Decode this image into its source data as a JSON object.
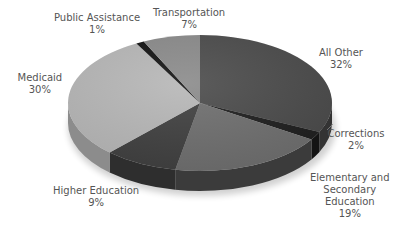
{
  "chart_data": {
    "type": "pie",
    "style": "3d-exploded-none",
    "title": "",
    "start_angle_deg": 0,
    "direction": "clockwise",
    "slices": [
      {
        "label": "All Other",
        "value": 32,
        "display": "32%",
        "color": "#4a4a4a",
        "side": "#333333"
      },
      {
        "label": "Corrections",
        "value": 2,
        "display": "2%",
        "color": "#1e1e1e",
        "side": "#141414"
      },
      {
        "label": "Elementary and Secondary Education",
        "value": 19,
        "display": "19%",
        "color": "#6e6e6e",
        "side": "#3b3b3b"
      },
      {
        "label": "Higher Education",
        "value": 9,
        "display": "9%",
        "color": "#3f3f3f",
        "side": "#2e2e2e"
      },
      {
        "label": "Medicaid",
        "value": 30,
        "display": "30%",
        "color": "#b7b7b7",
        "side": "#8c8c8c"
      },
      {
        "label": "Public Assistance",
        "value": 1,
        "display": "1%",
        "color": "#111111",
        "side": "#0a0a0a"
      },
      {
        "label": "Transportation",
        "value": 7,
        "display": "7%",
        "color": "#8a8a8a",
        "side": "#5e5e5e"
      }
    ]
  },
  "labels": [
    {
      "text": "All Other\n32%",
      "x": 341,
      "y": 47
    },
    {
      "text": "Corrections\n2%",
      "x": 356,
      "y": 128
    },
    {
      "text": "Elementary and\nSecondary\nEducation\n19%",
      "x": 350,
      "y": 172
    },
    {
      "text": "Higher Education\n9%",
      "x": 96,
      "y": 185
    },
    {
      "text": "Medicaid\n30%",
      "x": 40,
      "y": 72
    },
    {
      "text": "Public Assistance\n1%",
      "x": 97,
      "y": 12
    },
    {
      "text": "Transportation\n7%",
      "x": 189,
      "y": 7
    }
  ]
}
